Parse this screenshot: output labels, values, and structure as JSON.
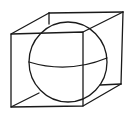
{
  "figure": {
    "title": "Sphere inscribed in a cube",
    "colors": {
      "background": "#ffffff",
      "line": "#1a1a1a"
    },
    "cube": {
      "front_face": {
        "top_left": [
          11,
          34
        ],
        "top_right": [
          83,
          32
        ],
        "bottom_right": [
          83,
          106
        ],
        "bottom_left": [
          11,
          107
        ]
      },
      "back_face": {
        "top_left": [
          49,
          13
        ],
        "top_right": [
          123,
          12
        ],
        "bottom_right": [
          121,
          84
        ],
        "bottom_left_hidden": [
          49,
          86
        ]
      }
    },
    "sphere": {
      "center": [
        68,
        62
      ],
      "radius_x": 39,
      "radius_y": 40
    },
    "equator": {
      "start": [
        29,
        62
      ],
      "mid": [
        68,
        70
      ],
      "end": [
        107,
        58
      ]
    }
  }
}
